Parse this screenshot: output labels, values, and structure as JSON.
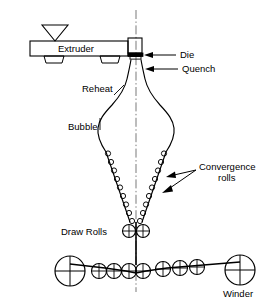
{
  "figure": {
    "domain": "diagram",
    "background_color": "#ffffff",
    "line_color": "#000000",
    "width": 270,
    "height": 303
  },
  "labels": {
    "extruder": "Extruder",
    "die": "Die",
    "quench": "Quench",
    "reheat": "Reheat",
    "bubble": "Bubble",
    "convergence_rolls_line1": "Convergence",
    "convergence_rolls_line2": "rolls",
    "draw_rolls": "Draw Rolls",
    "winder": "Winder"
  },
  "components": {
    "hopper": {
      "name": "hopper-funnel",
      "shape": "triangle"
    },
    "extruder_body": {
      "name": "extruder-body",
      "shape": "rectangle"
    },
    "extruder_feet": {
      "name": "extruder-feet",
      "count": 2
    },
    "die_block": {
      "name": "die-block"
    },
    "centerline": {
      "name": "centerline-axis",
      "style": "dash-dot"
    },
    "bubble_profile": {
      "name": "bubble-profile",
      "symmetric": true
    },
    "convergence_rolls": {
      "name": "convergence-rolls",
      "rolls_per_side": 9,
      "sides": 2,
      "roll_radius": 2.6
    },
    "draw_rolls": {
      "name": "draw-rolls",
      "count": 2,
      "radius": 6.5,
      "marker": "cross"
    },
    "bottom_rolls": {
      "name": "bottom-roll-train",
      "large_roll_radius": 15,
      "small_roll_radius": 7.5,
      "left_large_count": 1,
      "small_count": 8,
      "right_large_count": 1,
      "marker": "cross"
    }
  },
  "leader_arrows": {
    "die_arrow": "arrow-to-die",
    "quench_arrow": "arrow-to-quench",
    "convergence_arrow_upper": "arrow-to-upper-convergence-roll",
    "convergence_arrow_lower": "arrow-to-lower-convergence-roll"
  }
}
